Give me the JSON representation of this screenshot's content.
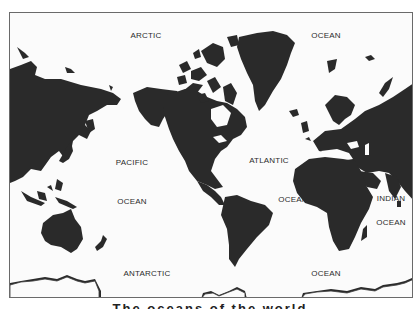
{
  "map": {
    "title": "World map with ocean labels",
    "land_color": "#2a2a2a",
    "water_color": "#fbfbfb",
    "labels": [
      {
        "id": "arctic",
        "text": "ARCTIC",
        "x": 145,
        "y": 34
      },
      {
        "id": "arctic-ocean",
        "text": "OCEAN",
        "x": 325,
        "y": 34
      },
      {
        "id": "pacific",
        "text": "PACIFIC",
        "x": 131,
        "y": 161
      },
      {
        "id": "pacific-ocean",
        "text": "OCEAN",
        "x": 131,
        "y": 200
      },
      {
        "id": "atlantic",
        "text": "ATLANTIC",
        "x": 268,
        "y": 159
      },
      {
        "id": "atlantic-ocean",
        "text": "OCEAN",
        "x": 292,
        "y": 198
      },
      {
        "id": "indian",
        "text": "INDIAN",
        "x": 390,
        "y": 197
      },
      {
        "id": "indian-ocean",
        "text": "OCEAN",
        "x": 390,
        "y": 221
      },
      {
        "id": "antarctic",
        "text": "ANTARCTIC",
        "x": 146,
        "y": 272
      },
      {
        "id": "antarctic-ocean",
        "text": "OCEAN",
        "x": 325,
        "y": 272
      }
    ]
  },
  "caption": {
    "text": "The oceans of the world"
  }
}
